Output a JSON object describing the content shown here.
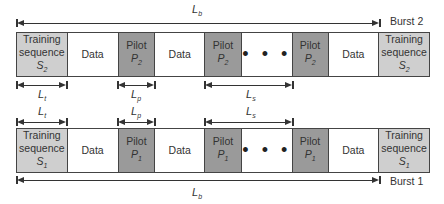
{
  "burst2": {
    "label": "Burst 2",
    "segments": [
      {
        "type": "training",
        "line1": "Training",
        "line2": "sequence",
        "sym": "S",
        "sub": "2",
        "width": 51
      },
      {
        "type": "data",
        "text": "Data",
        "width": 51
      },
      {
        "type": "pilot",
        "line1": "Pilot",
        "sym": "P",
        "sub": "2",
        "width": 37
      },
      {
        "type": "data",
        "text": "Data",
        "width": 50
      },
      {
        "type": "pilot",
        "line1": "Pilot",
        "sym": "P",
        "sub": "2",
        "width": 37
      },
      {
        "type": "dots",
        "text": "• • •",
        "width": 51
      },
      {
        "type": "pilot",
        "line1": "Pilot",
        "sym": "P",
        "sub": "2",
        "width": 36
      },
      {
        "type": "data",
        "text": "Data",
        "width": 51
      },
      {
        "type": "training",
        "line1": "Training",
        "line2": "sequence",
        "sym": "S",
        "sub": "2",
        "width": 50
      }
    ]
  },
  "burst1": {
    "label": "Burst 1",
    "segments": [
      {
        "type": "training",
        "line1": "Training",
        "line2": "sequence",
        "sym": "S",
        "sub": "1",
        "width": 51
      },
      {
        "type": "data",
        "text": "Data",
        "width": 51
      },
      {
        "type": "pilot",
        "line1": "Pilot",
        "sym": "P",
        "sub": "1",
        "width": 37
      },
      {
        "type": "data",
        "text": "Data",
        "width": 50
      },
      {
        "type": "pilot",
        "line1": "Pilot",
        "sym": "P",
        "sub": "1",
        "width": 37
      },
      {
        "type": "dots",
        "text": "• • •",
        "width": 51
      },
      {
        "type": "pilot",
        "line1": "Pilot",
        "sym": "P",
        "sub": "1",
        "width": 36
      },
      {
        "type": "data",
        "text": "Data",
        "width": 51
      },
      {
        "type": "training",
        "line1": "Training",
        "line2": "sequence",
        "sym": "S",
        "sub": "1",
        "width": 50
      }
    ]
  },
  "dimensions": {
    "burst_length": {
      "sym": "L",
      "sub": "b"
    },
    "training_length": {
      "sym": "L",
      "sub": "t"
    },
    "pilot_length": {
      "sym": "L",
      "sub": "p"
    },
    "pilot_spacing": {
      "sym": "L",
      "sub": "s"
    }
  },
  "colors": {
    "training": "#cfcfcf",
    "pilot": "#9a9a9a",
    "data": "#ffffff",
    "line": "#333333"
  }
}
